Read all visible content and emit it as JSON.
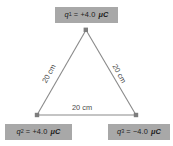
{
  "diagram": {
    "type": "equilateral-triangle-point-charges",
    "background_color": "#ffffff",
    "line_color": "#8a8a8a",
    "label_box_color": "#a8a8a8",
    "label_text_color": "#1c1c1c",
    "side_label_color": "#4a4a4a",
    "charges": [
      {
        "id": "q1",
        "position": "top",
        "symbol": "q",
        "subscript": "1",
        "equals": "=",
        "value": "+4.0",
        "unit": "μC",
        "full_label": "q₁ = +4.0 μC",
        "sign": "positive"
      },
      {
        "id": "q2",
        "position": "bottom-left",
        "symbol": "q",
        "subscript": "2",
        "equals": "=",
        "value": "+4.0",
        "unit": "μC",
        "full_label": "q₂ = +4.0 μC",
        "sign": "positive"
      },
      {
        "id": "q3",
        "position": "bottom-right",
        "symbol": "q",
        "subscript": "3",
        "equals": "=",
        "value": "−4.0",
        "unit": "μC",
        "full_label": "q₃ = −4.0 μC",
        "sign": "negative"
      }
    ],
    "sides": [
      {
        "id": "left",
        "label": "20 cm",
        "from": "q2",
        "to": "q1"
      },
      {
        "id": "right",
        "label": "20 cm",
        "from": "q1",
        "to": "q3"
      },
      {
        "id": "bottom",
        "label": "20 cm",
        "from": "q2",
        "to": "q3"
      }
    ],
    "vertices": [
      {
        "id": "q1",
        "x": 86,
        "y": 30
      },
      {
        "id": "q2",
        "x": 37,
        "y": 115
      },
      {
        "id": "q3",
        "x": 136,
        "y": 115
      }
    ]
  }
}
